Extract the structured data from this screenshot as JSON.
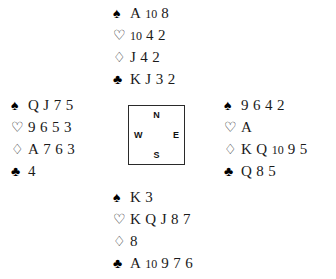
{
  "diagram": {
    "type": "bridge-deal",
    "suit_glyphs": {
      "spades": "♠",
      "hearts": "♡",
      "diamonds": "♢",
      "clubs": "♣"
    },
    "compass": {
      "north": "N",
      "south": "S",
      "west": "W",
      "east": "E"
    },
    "hands": {
      "north": {
        "label": "North",
        "spades": "A 10 8",
        "hearts": "10 4 2",
        "diamonds": "J 4 2",
        "clubs": "K J 3 2"
      },
      "west": {
        "label": "West",
        "spades": "Q J 7 5",
        "hearts": "9 6 5 3",
        "diamonds": "A 7 6 3",
        "clubs": "4"
      },
      "east": {
        "label": "East",
        "spades": "9 6 4 2",
        "hearts": "A",
        "diamonds": "K Q 10 9 5",
        "clubs": "Q 8 5"
      },
      "south": {
        "label": "South",
        "spades": "K 3",
        "hearts": "K Q J 8 7",
        "diamonds": "8",
        "clubs": "A 10 9 7 6"
      }
    }
  }
}
